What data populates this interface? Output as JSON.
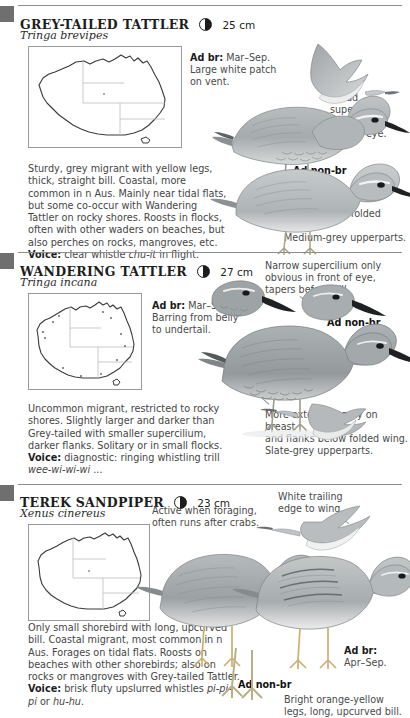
{
  "page": {
    "background": "#ffffff",
    "text_color": "#4a4a4a",
    "heading_color": "#1d1d1d",
    "tab_color": "#6f6f6f"
  },
  "species": [
    {
      "common_name": "GREY-TAILED TATTLER",
      "scientific_name": "Tringa brevipes",
      "size": "25 cm",
      "moon_icon": "half-moon-icon",
      "map_icon": "australia-distribution-map",
      "plumage_labels": [
        {
          "id": "ad-br",
          "bold": "Ad br:",
          "text": " Mar–Sep.",
          "line2": "Large white patch",
          "line3": "on vent."
        },
        {
          "id": "ad-non-br",
          "bold": "Ad non-br",
          "text": ""
        }
      ],
      "callouts": [
        {
          "id": "supercilium",
          "lines": [
            "Broad",
            "supercilium",
            "from bill to",
            "behind eye."
          ]
        },
        {
          "id": "flanks",
          "lines": [
            "Grey on flanks",
            "concealed by folded wings.",
            "Medium-grey upperparts."
          ]
        }
      ],
      "description": "Sturdy, grey migrant with yellow legs, thick, straight bill. Coastal, more common in n Aus. Mainly near tidal flats, but some co-occur with Wandering Tattler on rocky shores. Roosts in flocks, often with other waders on beaches, but also perches on rocks, mangroves, etc.",
      "voice_label": "Voice:",
      "voice_text": " clear whistle ",
      "voice_italic": "chu-it",
      "voice_tail": " in flight."
    },
    {
      "common_name": "WANDERING TATTLER",
      "scientific_name": "Tringa incana",
      "size": "27 cm",
      "moon_icon": "half-moon-icon",
      "map_icon": "australia-distribution-map",
      "plumage_labels": [
        {
          "id": "ad-br",
          "bold": "Ad br:",
          "text": " Mar–Sep.",
          "line2": "Barring from belly",
          "line3": "to undertail."
        },
        {
          "id": "ad-non-br",
          "bold": "Ad non-br",
          "text": ""
        }
      ],
      "callouts": [
        {
          "id": "supercilium",
          "lines": [
            "Narrow supercilium only",
            "obvious in front of eye,",
            "tapers before bill."
          ]
        },
        {
          "id": "breast",
          "lines": [
            "More extensive grey on breast",
            "and flanks below folded wing.",
            "Slate-grey upperparts."
          ]
        }
      ],
      "description": "Uncommon migrant, restricted to rocky shores. Slightly larger and darker than Grey-tailed with smaller supercilium, darker flanks. Solitary or in small flocks.",
      "voice_label": "Voice:",
      "voice_text": " diagnostic: ringing whistling trill ",
      "voice_italic": "wee-wi-wi-wi",
      "voice_tail": " ..."
    },
    {
      "common_name": "TEREK SANDPIPER",
      "scientific_name": "Xenus cinereus",
      "size": "23 cm",
      "moon_icon": "half-moon-icon",
      "map_icon": "australia-distribution-map",
      "plumage_labels": [
        {
          "id": "ad-br",
          "bold": "Ad br:",
          "text": "",
          "line2": "Apr–Sep.",
          "line3": ""
        },
        {
          "id": "ad-non-br",
          "bold": "Ad non-br",
          "text": ""
        }
      ],
      "callouts": [
        {
          "id": "behaviour",
          "lines": [
            "Active when foraging,",
            "often runs after crabs."
          ]
        },
        {
          "id": "wing",
          "lines": [
            "White trailing",
            "edge to wing."
          ]
        },
        {
          "id": "legs",
          "lines": [
            "Bright orange-yellow",
            "legs, long, upcurved bill."
          ]
        }
      ],
      "description": "Only small shorebird with long, upcurved bill. Coastal migrant, most common in n Aus. Forages on tidal flats. Roosts on beaches with other shorebirds; also on rocks or mangroves with Grey-tailed Tattler.",
      "voice_label": "Voice:",
      "voice_text": " brisk fluty upslurred whistles ",
      "voice_italic": "pi-pi-pi",
      "voice_tail2": " or ",
      "voice_italic2": "hu-hu",
      "voice_tail": "."
    }
  ]
}
